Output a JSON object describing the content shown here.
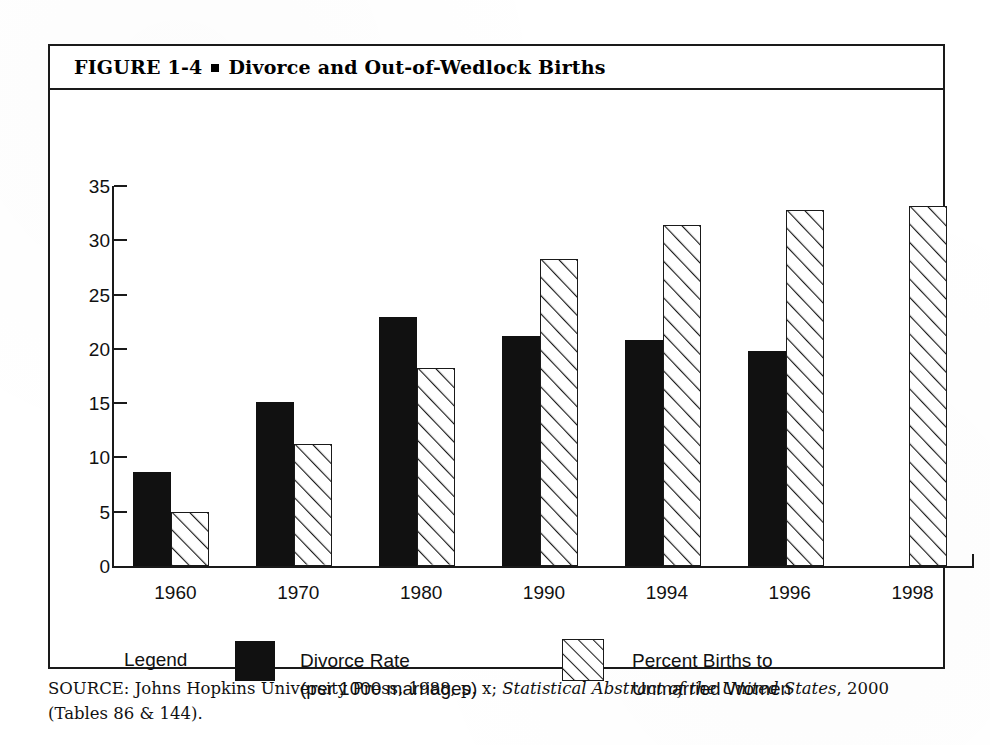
{
  "figure": {
    "label": "FIGURE  1-4",
    "bullet": "square-bullet",
    "title": "Divorce and Out-of-Wedlock Births"
  },
  "chart_data": {
    "type": "bar",
    "title": "Divorce and Out-of-Wedlock Births",
    "xlabel": "",
    "ylabel": "",
    "ylim": [
      0,
      35
    ],
    "yticks": [
      0,
      5,
      10,
      15,
      20,
      25,
      30,
      35
    ],
    "grid": false,
    "legend_position": "bottom",
    "categories": [
      "1960",
      "1970",
      "1980",
      "1990",
      "1994",
      "1996",
      "1998"
    ],
    "series": [
      {
        "name": "Divorce Rate (per 1000 marriages)",
        "style": "solid-black",
        "color": "#111111",
        "values": [
          8.7,
          15.1,
          22.9,
          21.2,
          20.8,
          19.8,
          null
        ]
      },
      {
        "name": "Percent Births to Unmarried Women",
        "style": "diagonal-hatch",
        "color": "#ffffff",
        "values": [
          5.0,
          11.2,
          18.2,
          28.3,
          31.4,
          32.8,
          33.2
        ]
      }
    ]
  },
  "legend": {
    "title": "Legend",
    "entries": [
      {
        "swatch": "solid-black-swatch",
        "line1": "Divorce Rate",
        "line2": "(per 1000 marriages)"
      },
      {
        "swatch": "hatched-swatch",
        "line1": "Percent Births to",
        "line2": "Unmarried Women"
      }
    ]
  },
  "source": {
    "prefix": "SOURCE: Johns Hopkins University Press, 1988, p. x; ",
    "italic": "Statistical Abstract of the United States",
    "suffix": ", 2000 (Tables 86 & 144)."
  },
  "colors": {
    "ink": "#111111",
    "frame": "#1a1a1a",
    "paper": "#ffffff"
  }
}
